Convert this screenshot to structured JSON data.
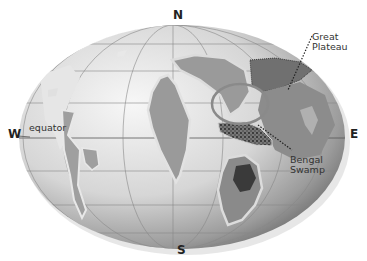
{
  "map": {
    "compass": {
      "north": "N",
      "south": "S",
      "east": "E",
      "west": "W"
    },
    "labels": {
      "equator": "equator",
      "great_plateau_line1": "Great",
      "great_plateau_line2": "Plateau",
      "bengal_swamp_line1": "Bengal",
      "bengal_swamp_line2": "Swamp"
    },
    "colors": {
      "ocean_light": "#f2f2f2",
      "ocean_dark": "#7a7a7a",
      "land": "#9a9a9a",
      "land_dark": "#6a6a6a",
      "shelf": "#d8d8d8",
      "ring": "#8a8a8a"
    }
  }
}
